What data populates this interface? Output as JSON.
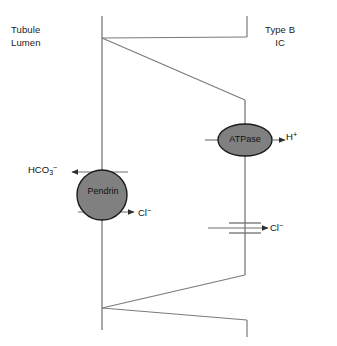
{
  "diagram": {
    "compartments": {
      "lumen_label_line1": "Tubule",
      "lumen_label_line2": "Lumen",
      "cell_label_line1": "Type B",
      "cell_label_line2": "IC"
    },
    "transporters": [
      {
        "name": "Pendrin",
        "label": "Pendrin",
        "shape": "circle",
        "membrane": "apical",
        "fill": "#808080",
        "stroke": "#1a1a1a",
        "cx": 102,
        "cy": 195,
        "r": 25
      },
      {
        "name": "ATPase",
        "label": "ATPase",
        "shape": "ellipse",
        "membrane": "basolateral",
        "fill": "#808080",
        "stroke": "#1a1a1a",
        "cx": 245,
        "cy": 140,
        "rx": 27,
        "ry": 16
      },
      {
        "name": "chloride-channel",
        "label": "",
        "shape": "channel-bars",
        "membrane": "basolateral",
        "cx": 245,
        "cy": 228
      }
    ],
    "ions": {
      "bicarbonate": "HCO",
      "bicarbonate_sub": "3",
      "bicarbonate_sup": "−",
      "chloride_apical": "Cl",
      "chloride_apical_sup": "−",
      "proton": "H",
      "proton_sup": "+",
      "chloride_basolateral": "Cl",
      "chloride_basolateral_sup": "−"
    },
    "colors": {
      "line": "#6e6e6e",
      "membrane": "#7a7a7a",
      "arrow": "#3c3c3c",
      "protein_fill": "#808080",
      "protein_stroke": "#1a1a1a",
      "background": "#ffffff",
      "text": "#111111"
    },
    "geometry": {
      "apical_membrane_x": 102,
      "basolateral_membrane_x": 245,
      "top_vertex_y": 38,
      "bottom_vertex_y": 308,
      "membrane_top_y": 16,
      "membrane_bottom_y": 330
    }
  }
}
